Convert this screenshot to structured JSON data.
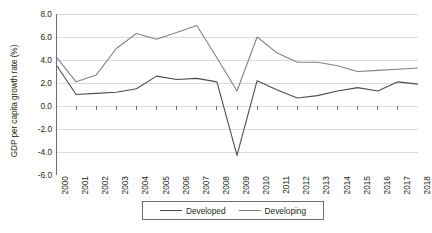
{
  "chart_data": {
    "type": "line",
    "title": "",
    "xlabel": "",
    "ylabel": "GDP per capita growth rate (%)",
    "x": [
      2000,
      2001,
      2002,
      2003,
      2004,
      2005,
      2006,
      2007,
      2008,
      2009,
      2010,
      2011,
      2012,
      2013,
      2014,
      2015,
      2016,
      2017,
      2018
    ],
    "categories": [
      "2000",
      "2001",
      "2002",
      "2003",
      "2004",
      "2005",
      "2006",
      "2007",
      "2008",
      "2009",
      "2010",
      "2011",
      "2012",
      "2013",
      "2014",
      "2015",
      "2016",
      "2017",
      "2018"
    ],
    "series": [
      {
        "name": "Developed",
        "color": "#4d4d4f",
        "values": [
          3.6,
          1.0,
          1.1,
          1.2,
          1.5,
          2.6,
          2.3,
          2.4,
          2.1,
          -4.3,
          2.2,
          1.4,
          0.7,
          0.9,
          1.3,
          1.6,
          1.3,
          2.1,
          1.9
        ]
      },
      {
        "name": "Developing",
        "color": "#808285",
        "values": [
          4.3,
          2.1,
          2.7,
          5.0,
          6.3,
          5.8,
          6.4,
          7.0,
          4.2,
          1.3,
          6.0,
          4.6,
          3.8,
          3.8,
          3.5,
          3.0,
          3.1,
          3.2,
          3.3
        ]
      }
    ],
    "ylim": [
      -6.0,
      8.0
    ],
    "yticks": [
      "8.0",
      "6.0",
      "4.0",
      "2.0",
      "0.0",
      "-2.0",
      "-4.0",
      "-6.0"
    ],
    "ytick_values": [
      8.0,
      6.0,
      4.0,
      2.0,
      0.0,
      -2.0,
      -4.0,
      -6.0
    ],
    "grid": true,
    "grid_color": "#d9dadb",
    "axis_color": "#6d6e71",
    "legend_position": "bottom"
  },
  "legend": {
    "entries": [
      {
        "label": "Developed"
      },
      {
        "label": "Developing"
      }
    ]
  }
}
